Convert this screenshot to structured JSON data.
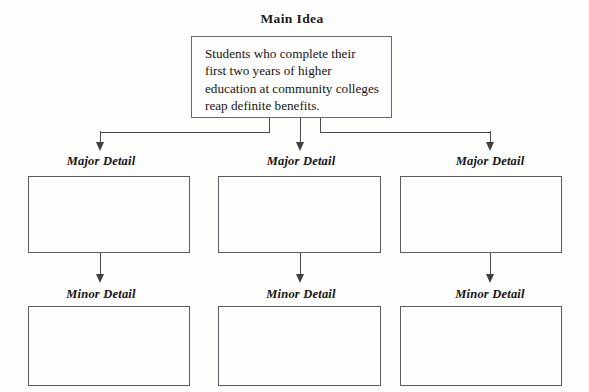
{
  "diagram": {
    "type": "main-idea-organizer",
    "main": {
      "heading": "Main Idea",
      "text": "Students who complete their first two years of higher education at community colleges reap definite benefits."
    },
    "major_label": "Major Detail",
    "minor_label": "Minor Detail",
    "columns": [
      {
        "major_heading": "Major Detail",
        "major_text": "",
        "minor_heading": "Minor Detail",
        "minor_text": ""
      },
      {
        "major_heading": "Major Detail",
        "major_text": "",
        "minor_heading": "Minor Detail",
        "minor_text": ""
      },
      {
        "major_heading": "Major Detail",
        "major_text": "",
        "minor_heading": "Minor Detail",
        "minor_text": ""
      }
    ],
    "colors": {
      "page_background": "#fdfdfc",
      "box_border": "#5d5d5d",
      "connector": "#4a4a4a",
      "text": "#151515"
    }
  }
}
